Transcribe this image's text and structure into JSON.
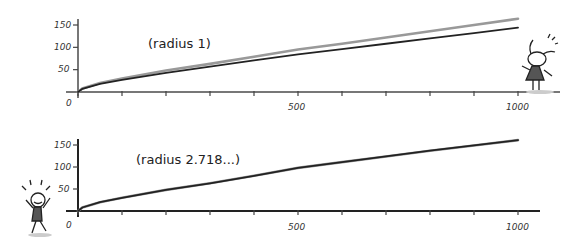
{
  "chart_data": [
    {
      "type": "line",
      "title": "",
      "annotation": "(radius 1)",
      "xlabel": "",
      "ylabel": "",
      "xlim": [
        0,
        1000
      ],
      "ylim": [
        0,
        150
      ],
      "x_ticks": [
        0,
        500,
        1000
      ],
      "x_minor_tick_step": 100,
      "y_ticks": [
        50,
        100,
        150
      ],
      "grid": false,
      "legend": null,
      "x": [
        0,
        10,
        50,
        100,
        200,
        300,
        400,
        500,
        600,
        700,
        800,
        900,
        1000
      ],
      "series": [
        {
          "name": "grey curve",
          "color": "#999999",
          "values": [
            0,
            8,
            20,
            30,
            48,
            63,
            79,
            95,
            108,
            122,
            136,
            150,
            164
          ]
        },
        {
          "name": "black curve",
          "color": "#222222",
          "values": [
            0,
            7,
            18,
            27,
            43,
            57,
            71,
            84,
            96,
            108,
            120,
            132,
            144
          ]
        }
      ]
    },
    {
      "type": "line",
      "title": "",
      "annotation": "(radius 2.718...)",
      "xlabel": "",
      "ylabel": "",
      "xlim": [
        0,
        1000
      ],
      "ylim": [
        0,
        150
      ],
      "x_ticks": [
        0,
        500,
        1000
      ],
      "x_minor_tick_step": 100,
      "y_ticks": [
        50,
        100,
        150
      ],
      "grid": false,
      "legend": null,
      "x": [
        0,
        10,
        50,
        100,
        200,
        300,
        400,
        500,
        600,
        700,
        800,
        900,
        1000
      ],
      "series": [
        {
          "name": "grey curve",
          "color": "#999999",
          "values": [
            0,
            8,
            20,
            30,
            48,
            63,
            80,
            98,
            111,
            124,
            137,
            149,
            161
          ]
        },
        {
          "name": "black curve",
          "color": "#222222",
          "values": [
            0,
            8,
            20,
            30,
            48,
            63,
            80,
            98,
            111,
            124,
            137,
            149,
            161
          ]
        }
      ]
    }
  ],
  "labels": {
    "top_annotation": "(radius 1)",
    "bottom_annotation": "(radius 2.718...)",
    "y_tick_150": "150",
    "y_tick_100": "100",
    "y_tick_50": "50",
    "x_tick_0": "0",
    "x_tick_500": "500",
    "x_tick_1000": "1000"
  }
}
